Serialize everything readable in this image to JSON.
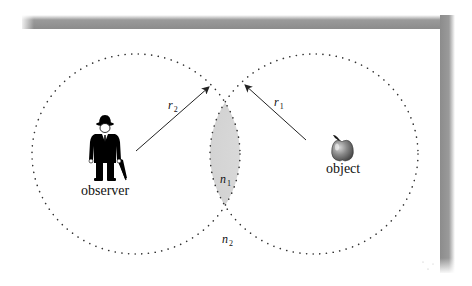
{
  "diagram": {
    "observer": {
      "label": "observer",
      "icon": "gentleman-with-umbrella-icon"
    },
    "object": {
      "label": "object",
      "icon": "apple-icon"
    },
    "left_region": {
      "radius_label": {
        "symbol": "r",
        "subscript": "2"
      }
    },
    "right_region": {
      "radius_label": {
        "symbol": "r",
        "subscript": "1"
      }
    },
    "overlap_region": {
      "label": {
        "symbol": "n",
        "subscript": "1"
      }
    },
    "outside_region": {
      "label": {
        "symbol": "n",
        "subscript": "2"
      }
    },
    "colors": {
      "background": "#ffffff",
      "shadow": "#8a8a8a",
      "dots": "#333333",
      "lens_fill": "#d9d9d9",
      "arrow": "#222222",
      "apple": "#7a7a7a"
    }
  }
}
